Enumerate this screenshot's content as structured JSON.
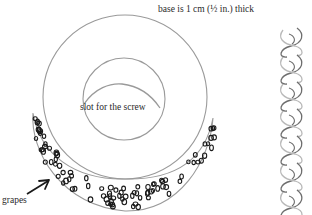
{
  "diagram": {
    "title_note": "base is 1 cm (½ in.) thick",
    "labels": {
      "slot": "slot for the screw",
      "grapes": "grapes"
    },
    "parts": [
      {
        "name": "outer-ring",
        "description": "circular dough base"
      },
      {
        "name": "inner-circle",
        "description": "centre hole"
      },
      {
        "name": "screw-slot",
        "description": "arched slot inside the centre hole"
      },
      {
        "name": "grape-band",
        "description": "crescent band of grapes along the lower edge"
      },
      {
        "name": "braid",
        "description": "vertical plaited dough strand"
      }
    ],
    "colors": {
      "outline": "#9a9a9a",
      "ink": "#1a1a1a",
      "braid_dark": "#6e6e6e",
      "braid_light": "#b8b8b8"
    }
  }
}
